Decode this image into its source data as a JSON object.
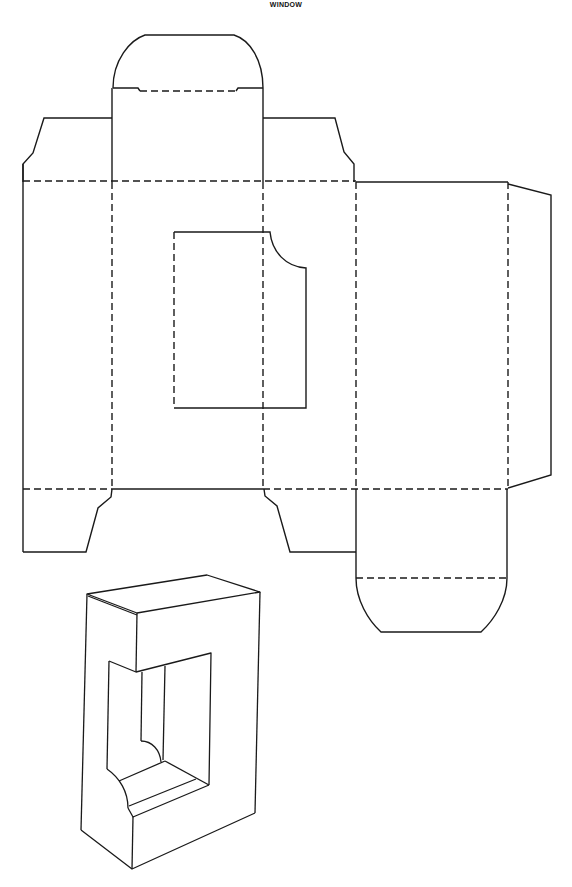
{
  "title": "WINDOW",
  "diagram": {
    "type": "box-dieline-template",
    "colors": {
      "line": "#1a1a1a",
      "background": "#ffffff"
    },
    "line_styles": {
      "cut": "solid",
      "fold": "dashed"
    },
    "parts": [
      {
        "name": "top-tuck-flap",
        "shape": "rounded tab"
      },
      {
        "name": "top-dust-flap-left"
      },
      {
        "name": "top-dust-flap-right"
      },
      {
        "name": "side-panel-left"
      },
      {
        "name": "front-panel-with-window"
      },
      {
        "name": "side-panel-right"
      },
      {
        "name": "back-panel"
      },
      {
        "name": "glue-flap"
      },
      {
        "name": "bottom-dust-flap-left"
      },
      {
        "name": "bottom-dust-flap-right"
      },
      {
        "name": "bottom-tuck-flap",
        "shape": "rounded tab"
      },
      {
        "name": "window-cutout",
        "shape": "rectangle with rounded notch"
      },
      {
        "name": "assembled-box-illustration"
      }
    ]
  }
}
